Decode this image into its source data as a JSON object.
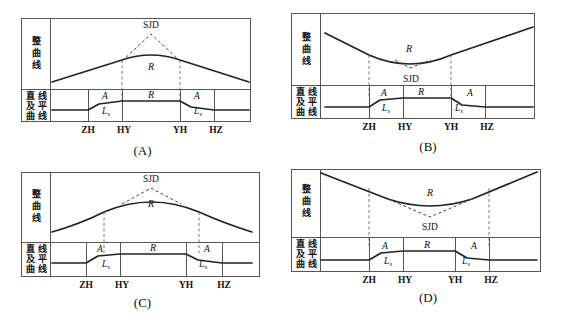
{
  "figure": {
    "panel_order": [
      "A",
      "B",
      "C",
      "D"
    ]
  },
  "labels": {
    "profile_row": "整曲线",
    "profile_row_chars": [
      "整",
      "曲",
      "线"
    ],
    "plan_row": "直线及平曲线",
    "plan_row_grid": [
      [
        "直",
        "线"
      ],
      [
        "及",
        "平"
      ],
      [
        "曲",
        "线"
      ]
    ],
    "sjd": "SJD",
    "radius": "R",
    "spiral_param": "A",
    "spiral_length": "L",
    "spiral_length_sub": "s"
  },
  "ticks": [
    "ZH",
    "HY",
    "YH",
    "HZ"
  ],
  "panels": [
    {
      "id": "A",
      "caption": "(A)",
      "vertical_curve_type": "crest",
      "sjd_position": "above",
      "dash_alignment": [
        "HY",
        "YH"
      ],
      "note": "Crest vertical curve; vertical curve tangent points coincide with HY and YH"
    },
    {
      "id": "B",
      "caption": "(B)",
      "vertical_curve_type": "sag",
      "sjd_position": "below",
      "dash_alignment": [
        "ZH",
        "YH"
      ],
      "note": "Sag vertical curve; tangent points at ZH and YH"
    },
    {
      "id": "C",
      "caption": "(C)",
      "vertical_curve_type": "crest",
      "sjd_position": "above",
      "dash_alignment": [
        "mid-ZH-HY",
        "mid-YH-HZ"
      ],
      "note": "Crest vertical curve; tangent points fall inside the transition (A/Ls) zones"
    },
    {
      "id": "D",
      "caption": "(D)",
      "vertical_curve_type": "sag",
      "sjd_position": "below",
      "dash_alignment": [
        "ZH",
        "HZ"
      ],
      "note": "Sag vertical curve; tangent points at ZH and HZ spanning the whole curve"
    }
  ],
  "colors": {
    "line": "#222222",
    "frame": "#555555",
    "dashed": "#444444",
    "text": "#111111",
    "background": "#ffffff"
  }
}
